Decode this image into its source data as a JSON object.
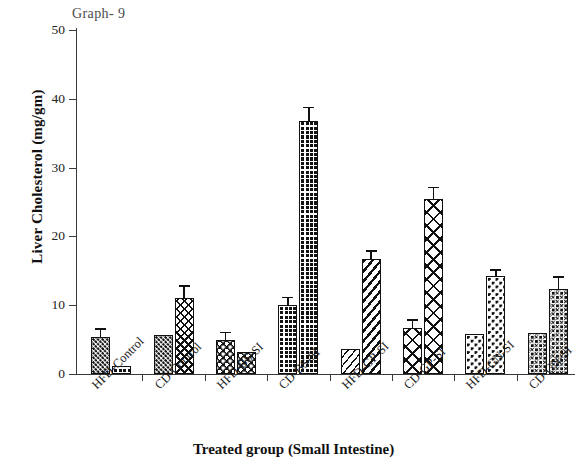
{
  "annotation": "Graph- 9",
  "axes": {
    "ylabel": "Liver Cholesterol (mg/gm)",
    "xlabel": "Treated group (Small Intestine)",
    "yticks": [
      "0",
      "10",
      "20",
      "30",
      "40",
      "50"
    ]
  },
  "chart_data": {
    "type": "bar",
    "title": "Graph- 9",
    "xlabel": "Treated group (Small Intestine)",
    "ylabel": "Liver Cholesterol (mg/gm)",
    "ylim": [
      0,
      50
    ],
    "ytick_values": [
      0,
      10,
      20,
      30,
      40,
      50
    ],
    "grid": false,
    "legend": "none",
    "categories": [
      "HFD-Control",
      "CD-Control",
      "HFD-BS-SI",
      "CD-BS-SI",
      "HFD-GP-SI",
      "CD-GP-SI",
      "HFD-GN-SI",
      "CD-GN-SI"
    ],
    "series": [
      {
        "name": "bar-1",
        "values": [
          5.4,
          5.6,
          4.9,
          10.1,
          3.6,
          6.7,
          5.8,
          6.0
        ],
        "errors": [
          0.5,
          0.0,
          0.5,
          0.4,
          0.0,
          0.5,
          0.0,
          0.0
        ]
      },
      {
        "name": "bar-2",
        "values": [
          1.2,
          11.1,
          3.2,
          36.8,
          16.7,
          25.5,
          14.2,
          12.3
        ],
        "errors": [
          0.0,
          1.1,
          0.0,
          1.3,
          0.6,
          1.0,
          0.3,
          1.2
        ]
      }
    ],
    "bars": [
      {
        "group": "HFD-Control",
        "index": 0,
        "value": 5.4,
        "error": 0.5,
        "pattern": "small-dots"
      },
      {
        "group": "HFD-Control",
        "index": 1,
        "value": 1.2,
        "error": 0.0,
        "pattern": "grid-dark"
      },
      {
        "group": "CD-Control",
        "index": 0,
        "value": 5.6,
        "error": 0.0,
        "pattern": "small-dots"
      },
      {
        "group": "CD-Control",
        "index": 1,
        "value": 11.1,
        "error": 1.1,
        "pattern": "x-hatch-dark"
      },
      {
        "group": "HFD-BS-SI",
        "index": 0,
        "value": 4.9,
        "error": 0.5,
        "pattern": "big-dots"
      },
      {
        "group": "HFD-BS-SI",
        "index": 1,
        "value": 3.2,
        "error": 0.0,
        "pattern": "big-dots"
      },
      {
        "group": "CD-BS-SI",
        "index": 0,
        "value": 10.1,
        "error": 0.4,
        "pattern": "grid-dark"
      },
      {
        "group": "CD-BS-SI",
        "index": 1,
        "value": 36.8,
        "error": 1.3,
        "pattern": "grid-dark"
      },
      {
        "group": "HFD-GP-SI",
        "index": 0,
        "value": 3.6,
        "error": 0.0,
        "pattern": "diagonal-light"
      },
      {
        "group": "HFD-GP-SI",
        "index": 1,
        "value": 16.7,
        "error": 0.6,
        "pattern": "diagonal"
      },
      {
        "group": "CD-GP-SI",
        "index": 0,
        "value": 6.7,
        "error": 0.5,
        "pattern": "x-hatch-open"
      },
      {
        "group": "CD-GP-SI",
        "index": 1,
        "value": 25.5,
        "error": 1.0,
        "pattern": "x-hatch-open"
      },
      {
        "group": "HFD-GN-SI",
        "index": 0,
        "value": 5.8,
        "error": 0.0,
        "pattern": "sparse-dots"
      },
      {
        "group": "HFD-GN-SI",
        "index": 1,
        "value": 14.2,
        "error": 0.3,
        "pattern": "sparse-dots"
      },
      {
        "group": "CD-GN-SI",
        "index": 0,
        "value": 6.0,
        "error": 0.0,
        "pattern": "ring-dots"
      },
      {
        "group": "CD-GN-SI",
        "index": 1,
        "value": 12.3,
        "error": 1.2,
        "pattern": "ring-dots"
      }
    ]
  },
  "colors": {
    "ink": "#111111",
    "axis": "#3a3a3a",
    "background": "#ffffff",
    "annotation": "#4a4a4a"
  }
}
